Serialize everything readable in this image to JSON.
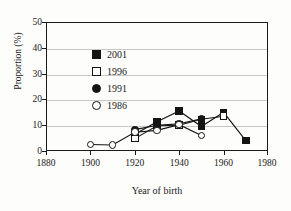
{
  "chart_data": {
    "type": "line",
    "title": "",
    "xlabel": "Year of birth",
    "ylabel": "Proportion (%)",
    "xlim": [
      1880,
      1980
    ],
    "ylim": [
      0,
      50
    ],
    "xticks": [
      1880,
      1900,
      1920,
      1940,
      1960,
      1980
    ],
    "yticks": [
      0,
      10,
      20,
      30,
      40,
      50
    ],
    "grid": "horizontal",
    "legend_position": "upper-left-inside",
    "series": [
      {
        "name": "2001",
        "marker": "filled-square",
        "color": "#141414",
        "x": [
          1920,
          1930,
          1940,
          1950,
          1960,
          1970
        ],
        "values": [
          6.5,
          11.3,
          15.5,
          9.5,
          15.0,
          4.0
        ]
      },
      {
        "name": "1996",
        "marker": "open-square",
        "color": "#141414",
        "x": [
          1920,
          1930,
          1940,
          1950,
          1960
        ],
        "values": [
          4.8,
          9.8,
          10.0,
          12.3,
          13.5
        ]
      },
      {
        "name": "1991",
        "marker": "filled-circle",
        "color": "#141414",
        "x": [
          1920,
          1930,
          1940,
          1950
        ],
        "values": [
          8.3,
          10.0,
          10.5,
          12.5
        ]
      },
      {
        "name": "1986",
        "marker": "open-circle",
        "color": "#141414",
        "x": [
          1900,
          1910,
          1920,
          1930,
          1940,
          1950
        ],
        "values": [
          2.5,
          2.3,
          7.3,
          8.0,
          10.2,
          6.0
        ]
      }
    ]
  },
  "legend": {
    "entries": [
      {
        "label": "2001",
        "marker": "filled-square"
      },
      {
        "label": "1996",
        "marker": "open-square"
      },
      {
        "label": "1991",
        "marker": "filled-circle"
      },
      {
        "label": "1986",
        "marker": "open-circle"
      }
    ]
  },
  "axes": {
    "y_title": "Proportion (%)",
    "x_title": "Year of birth",
    "y_tick_labels": [
      "50",
      "40",
      "30",
      "20",
      "10",
      "0"
    ],
    "x_tick_labels": [
      "1880",
      "1900",
      "1920",
      "1940",
      "1960",
      "1980"
    ]
  }
}
